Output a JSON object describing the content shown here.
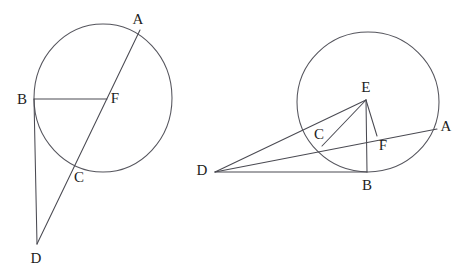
{
  "figure": {
    "width": 463,
    "height": 273,
    "background_color": "#ffffff",
    "stroke_color": "#4a4a52",
    "label_color": "#1d1d22"
  },
  "left_figure": {
    "name": "left-circle-diagram",
    "circle": {
      "cx": 103,
      "cy": 98,
      "rx": 69,
      "ry": 74
    },
    "points": {
      "A": {
        "x": 136,
        "y": 37,
        "label": "A",
        "label_x": 138,
        "label_y": 19
      },
      "B": {
        "x": 34,
        "y": 99,
        "label": "B",
        "label_x": 22,
        "label_y": 99
      },
      "C": {
        "x": 74,
        "y": 162,
        "label": "C",
        "label_x": 79,
        "label_y": 177
      },
      "D": {
        "x": 37,
        "y": 244,
        "label": "D",
        "label_x": 36,
        "label_y": 258
      },
      "F": {
        "x": 105,
        "y": 99,
        "label": "F",
        "label_x": 115,
        "label_y": 98
      }
    },
    "segments": [
      {
        "name": "segment-A-D",
        "from": "A",
        "to": "D"
      },
      {
        "name": "segment-B-F",
        "from": "B",
        "to": "F"
      },
      {
        "name": "segment-B-D",
        "from": "B",
        "to": "D"
      }
    ]
  },
  "right_figure": {
    "name": "right-circle-diagram",
    "circle": {
      "cx": 368,
      "cy": 102,
      "rx": 71,
      "ry": 70
    },
    "points": {
      "A": {
        "x": 434,
        "y": 130,
        "label": "A",
        "label_x": 446,
        "label_y": 126
      },
      "B": {
        "x": 367,
        "y": 172,
        "label": "B",
        "label_x": 367,
        "label_y": 185
      },
      "C": {
        "x": 324,
        "y": 143,
        "label": "C",
        "label_x": 319,
        "label_y": 134
      },
      "D": {
        "x": 215,
        "y": 172,
        "label": "D",
        "label_x": 202,
        "label_y": 170
      },
      "E": {
        "x": 366,
        "y": 100,
        "label": "E",
        "label_x": 366,
        "label_y": 87
      },
      "F": {
        "x": 376,
        "y": 135,
        "label": "F",
        "label_x": 383,
        "label_y": 145
      }
    },
    "segments": [
      {
        "name": "segment-D-A",
        "from": "D",
        "to": "A"
      },
      {
        "name": "segment-D-E",
        "from": "D",
        "to": "E"
      },
      {
        "name": "segment-D-B",
        "from": "D",
        "to": "B"
      },
      {
        "name": "segment-E-B",
        "from": "E",
        "to": "B"
      },
      {
        "name": "segment-E-C",
        "from": "E",
        "to": "C"
      },
      {
        "name": "segment-E-F",
        "from": "E",
        "to": "F"
      }
    ]
  }
}
